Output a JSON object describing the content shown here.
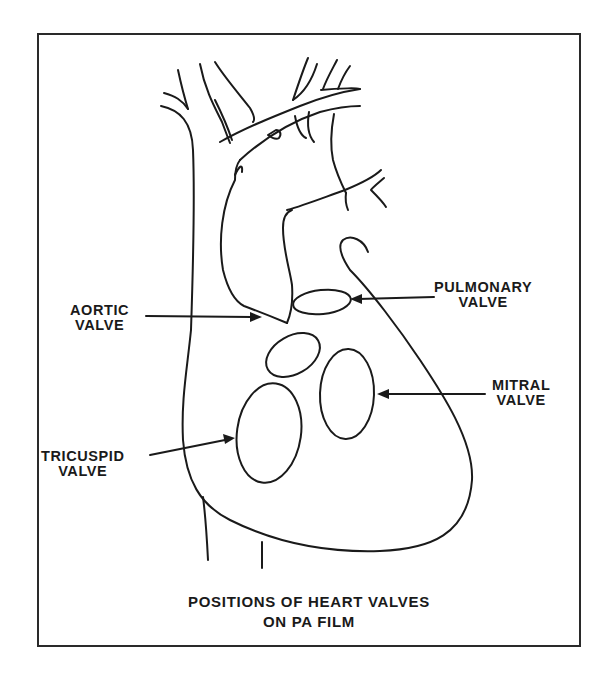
{
  "figure": {
    "title_line1": "POSITIONS OF HEART VALVES",
    "title_line2": "ON PA FILM",
    "stroke_color": "#1a1a1a",
    "background": "#ffffff"
  },
  "labels": {
    "pulmonary": {
      "line1": "PULMONARY",
      "line2": "VALVE"
    },
    "aortic": {
      "line1": "AORTIC",
      "line2": "VALVE"
    },
    "mitral": {
      "line1": "MITRAL",
      "line2": "VALVE"
    },
    "tricuspid": {
      "line1": "TRICUSPID",
      "line2": "VALVE"
    }
  },
  "valves": [
    {
      "name": "pulmonary valve",
      "cx": 322,
      "cy": 302,
      "rx": 29,
      "ry": 12,
      "rotate": -6
    },
    {
      "name": "aortic valve",
      "cx": 293,
      "cy": 355,
      "rx": 29,
      "ry": 19,
      "rotate": -30
    },
    {
      "name": "mitral valve",
      "cx": 347,
      "cy": 394,
      "rx": 27,
      "ry": 45,
      "rotate": 2
    },
    {
      "name": "tricuspid valve",
      "cx": 269,
      "cy": 433,
      "rx": 32,
      "ry": 50,
      "rotate": 8
    }
  ]
}
